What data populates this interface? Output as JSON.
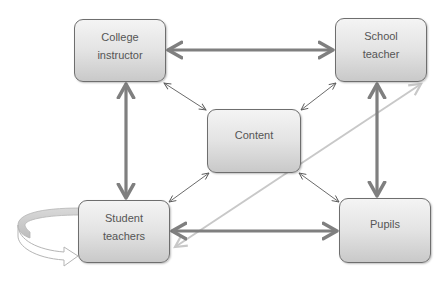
{
  "diagram": {
    "nodes": {
      "college_instructor": {
        "label": "College\ninstructor"
      },
      "school_teacher": {
        "label": "School\nteacher"
      },
      "content": {
        "label": "Content"
      },
      "student_teachers": {
        "label": "Student\nteachers"
      },
      "pupils": {
        "label": "Pupils"
      }
    },
    "edges": [
      {
        "from": "College instructor",
        "to": "School teacher",
        "style": "thick",
        "direction": "both"
      },
      {
        "from": "College instructor",
        "to": "Student teachers",
        "style": "thick",
        "direction": "both"
      },
      {
        "from": "School teacher",
        "to": "Pupils",
        "style": "thick",
        "direction": "both"
      },
      {
        "from": "Student teachers",
        "to": "Pupils",
        "style": "thick",
        "direction": "both"
      },
      {
        "from": "Content",
        "to": "College instructor",
        "style": "thin",
        "direction": "both"
      },
      {
        "from": "Content",
        "to": "School teacher",
        "style": "thin",
        "direction": "both"
      },
      {
        "from": "Content",
        "to": "Student teachers",
        "style": "thin",
        "direction": "both"
      },
      {
        "from": "Content",
        "to": "Pupils",
        "style": "thin",
        "direction": "both"
      },
      {
        "from": "Student teachers",
        "to": "School teacher",
        "style": "light",
        "direction": "both"
      },
      {
        "from": "Student teachers",
        "to": "Student teachers",
        "style": "circular-self-loop",
        "direction": "cycle"
      }
    ],
    "colors": {
      "thick_arrow": "#7f7f7f",
      "thin_arrow": "#595959",
      "light_arrow": "#c8c8c8",
      "node_border": "#6e6e6e",
      "node_text": "#555555"
    }
  }
}
